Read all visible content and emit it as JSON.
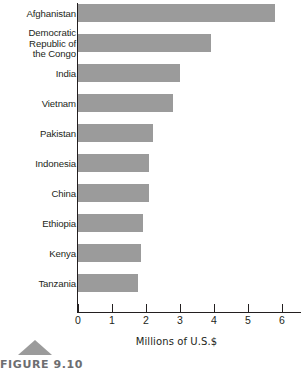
{
  "figure": {
    "caption_label": "FIGURE 9.10",
    "caption_marker_icon": "triangle-marker-icon"
  },
  "chart_data": {
    "type": "bar",
    "orientation": "horizontal",
    "title": "",
    "subtitle": "",
    "xlabel": "Millions of U.S.$",
    "ylabel": "",
    "categories": [
      "Afghanistan",
      "Democratic\nRepublic of\nthe Congo",
      "India",
      "Vietnam",
      "Pakistan",
      "Indonesia",
      "China",
      "Ethiopia",
      "Kenya",
      "Tanzania"
    ],
    "values": [
      5.8,
      3.9,
      3.0,
      2.8,
      2.2,
      2.1,
      2.1,
      1.9,
      1.85,
      1.75
    ],
    "xlim": [
      0,
      6.6
    ],
    "xticks": [
      0,
      1,
      2,
      3,
      4,
      5,
      6
    ],
    "xtick_labels": [
      "0",
      "1",
      "2",
      "3",
      "4",
      "5",
      "6"
    ],
    "grid": false,
    "legend": null,
    "bar_color": "#9b9b9b",
    "axis_color": "#231f20",
    "background_color": "#ffffff"
  }
}
